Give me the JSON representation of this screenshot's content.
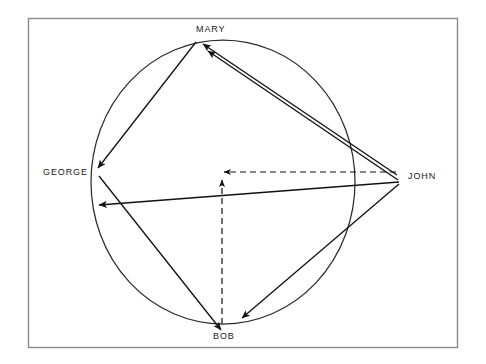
{
  "diagram": {
    "type": "sociogram",
    "title": "",
    "frame": {
      "x": 28,
      "y": 18,
      "width": 430,
      "height": 330,
      "stroke_color": "#8a8a8a",
      "fill_color": "#ffffff"
    },
    "circle": {
      "cx": 223,
      "cy": 182,
      "rx": 132,
      "ry": 142,
      "stroke_color": "#2b2b2b"
    },
    "center_point": {
      "x": 223,
      "y": 180
    },
    "colors": {
      "line": "#111111",
      "dashed_line": "#111111",
      "circle": "#2b2b2b",
      "frame": "#8a8a8a",
      "text": "#1a1a1a",
      "background": "#ffffff"
    },
    "nodes": [
      {
        "id": "mary",
        "label": "MARY",
        "x": 196,
        "y": 42,
        "position": "top",
        "on_circle": true
      },
      {
        "id": "george",
        "label": "GEORGE",
        "x": 97,
        "y": 173,
        "position": "left",
        "on_circle": true
      },
      {
        "id": "bob",
        "label": "BOB",
        "x": 222,
        "y": 325,
        "position": "bottom",
        "on_circle": true
      },
      {
        "id": "john",
        "label": "JOHN",
        "x": 400,
        "y": 178,
        "position": "right-outside",
        "on_circle": false
      }
    ],
    "edges": [
      {
        "id": "john-mary-1",
        "from": "john",
        "to": "mary",
        "style": "solid",
        "arrow": "to",
        "label": ""
      },
      {
        "id": "john-mary-2",
        "from": "john",
        "to": "mary",
        "style": "solid",
        "arrow": "to",
        "label": ""
      },
      {
        "id": "mary-george",
        "from": "mary",
        "to": "george",
        "style": "solid",
        "arrow": "to",
        "label": ""
      },
      {
        "id": "john-george",
        "from": "john",
        "to": "george",
        "style": "solid",
        "arrow": "to",
        "label": ""
      },
      {
        "id": "john-bob",
        "from": "john",
        "to": "bob",
        "style": "solid",
        "arrow": "to",
        "label": ""
      },
      {
        "id": "george-bob",
        "from": "george",
        "to": "bob",
        "style": "solid",
        "arrow": "to",
        "label": ""
      },
      {
        "id": "john-center",
        "from": "john",
        "to": "center",
        "style": "dashed",
        "arrow": "to",
        "label": ""
      },
      {
        "id": "bob-center",
        "from": "bob",
        "to": "center",
        "style": "dashed",
        "arrow": "to",
        "label": ""
      }
    ]
  }
}
